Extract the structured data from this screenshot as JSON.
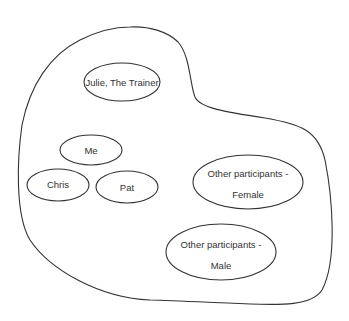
{
  "diagram": {
    "type": "group-membership",
    "colors": {
      "stroke": "#333333",
      "background": "#ffffff",
      "text": "#333333"
    },
    "nodes": [
      {
        "id": "julie",
        "label": "Julie, The Trainer",
        "lines": [
          "Julie, The Trainer"
        ],
        "cx": 122,
        "cy": 82,
        "rx": 38,
        "ry": 19
      },
      {
        "id": "me",
        "label": "Me",
        "lines": [
          "Me"
        ],
        "cx": 91,
        "cy": 150,
        "rx": 31,
        "ry": 15
      },
      {
        "id": "chris",
        "label": "Chris",
        "lines": [
          "Chris"
        ],
        "cx": 58,
        "cy": 185,
        "rx": 31,
        "ry": 16
      },
      {
        "id": "pat",
        "label": "Pat",
        "lines": [
          "Pat"
        ],
        "cx": 127,
        "cy": 187,
        "rx": 31,
        "ry": 16
      },
      {
        "id": "female",
        "label": "Other participants - Female",
        "lines": [
          "Other participants -",
          "Female"
        ],
        "cx": 248,
        "cy": 182,
        "rx": 55,
        "ry": 27
      },
      {
        "id": "male",
        "label": "Other participants - Male",
        "lines": [
          "Other participants -",
          "Male"
        ],
        "cx": 221,
        "cy": 252,
        "rx": 55,
        "ry": 28
      }
    ]
  }
}
